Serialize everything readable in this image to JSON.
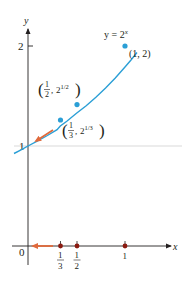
{
  "figure": {
    "type": "function-graph",
    "function_label": "y = 2^x",
    "function_label_parts": {
      "lhs": "y = 2",
      "exp": "x"
    },
    "axes": {
      "x_label": "x",
      "y_label": "y",
      "origin_label": "0",
      "y_ticks": [
        {
          "value": 1,
          "label": "1"
        },
        {
          "value": 2,
          "label": "2"
        }
      ],
      "x_ticks": [
        {
          "value": 0.3333,
          "num": "1",
          "den": "3"
        },
        {
          "value": 0.5,
          "num": "1",
          "den": "2"
        },
        {
          "value": 1,
          "label": "1"
        }
      ]
    },
    "points": [
      {
        "x": 1,
        "y": 2,
        "label": "(1, 2)"
      },
      {
        "x": 0.5,
        "y": 1.4142,
        "label_num": "1",
        "label_den": "2",
        "label_base": "2",
        "label_exp": "1/2"
      },
      {
        "x": 0.3333,
        "y": 1.2599,
        "label_num": "1",
        "label_den": "3",
        "label_base": "2",
        "label_exp": "1/3"
      }
    ],
    "annotations": {
      "curve_arrow": "arrow along curve toward (0, 1)",
      "axis_arrow": "arrow along x-axis toward 0"
    },
    "colors": {
      "curve": "#2b9fd6",
      "points": "#2b9fd6",
      "arrow": "#e06a3c",
      "axis_points": "#8b1a10",
      "axis": "#231f20",
      "guide": "#e8e8e8"
    }
  }
}
